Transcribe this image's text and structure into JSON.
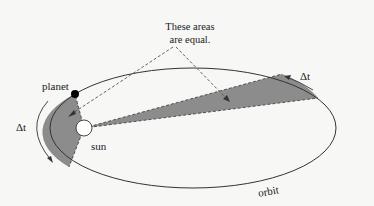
{
  "diagram": {
    "type": "kepler-second-law",
    "annotation": {
      "line1": "These areas",
      "line2": "are equal."
    },
    "labels": {
      "planet": "planet",
      "sun": "sun",
      "orbit": "orbit",
      "delta_t_right": "Δt",
      "delta_t_left": "Δt"
    },
    "colors": {
      "background": "#f7f7f5",
      "orbit_stroke": "#333333",
      "shaded_area": "#8c8c8c",
      "planet_fill": "#000000",
      "sun_fill": "#ffffff"
    }
  }
}
